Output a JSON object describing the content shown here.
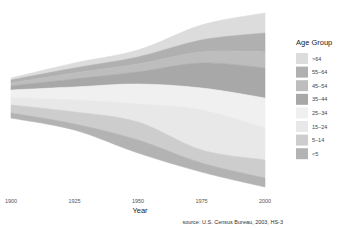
{
  "chart_data": {
    "type": "area",
    "subtype": "streamgraph",
    "title": "",
    "xlabel": "Year",
    "ylabel": "",
    "x": [
      1900,
      1925,
      1950,
      1975,
      2000
    ],
    "x_ticks": [
      "1900",
      "1925",
      "1950",
      "1975",
      "2000"
    ],
    "legend_title": "Age Group",
    "legend_position": "right",
    "grid": false,
    "source": "source: U.S. Census Bureau, 2003, HS-3",
    "series": [
      {
        "name": ">64",
        "color": "#dcdcdc",
        "values": [
          3.1,
          5.0,
          12.3,
          22.7,
          35.0
        ]
      },
      {
        "name": "55-64",
        "color": "#b0b0b0",
        "values": [
          4.0,
          7.0,
          13.4,
          19.0,
          24.3
        ]
      },
      {
        "name": "45-54",
        "color": "#bdbdbd",
        "values": [
          6.4,
          10.5,
          17.4,
          22.8,
          37.7
        ]
      },
      {
        "name": "35-44",
        "color": "#a8a8a8",
        "values": [
          9.1,
          14.0,
          21.5,
          25.6,
          45.1
        ]
      },
      {
        "name": "25-34",
        "color": "#f0f0f0",
        "values": [
          12.1,
          17.8,
          24.0,
          37.1,
          39.9
        ]
      },
      {
        "name": "15-24",
        "color": "#e8e8e8",
        "values": [
          14.9,
          20.7,
          22.1,
          39.6,
          39.2
        ]
      },
      {
        "name": "5-14",
        "color": "#cdcdcd",
        "values": [
          17.0,
          22.5,
          24.3,
          40.7,
          41.1
        ]
      },
      {
        "name": "<5",
        "color": "#b3b3b3",
        "values": [
          9.2,
          11.5,
          16.2,
          16.2,
          19.2
        ]
      }
    ],
    "units": "millions of people (approx.)"
  },
  "layout": {
    "plot": {
      "x0": 11,
      "x1": 265,
      "center_y": 100
    },
    "band_pixels": {
      "note": "top-to-bottom band boundaries (y px) at each x tick",
      "1900": [
        78,
        80,
        83,
        86,
        90,
        98,
        105,
        113,
        118
      ],
      "1925": [
        63,
        68,
        73,
        79,
        87,
        100,
        112,
        124,
        130
      ],
      "1950": [
        50,
        57,
        64,
        72,
        84,
        104,
        122,
        140,
        153
      ],
      "1975": [
        25,
        40,
        52,
        63,
        88,
        110,
        150,
        163,
        172
      ],
      "2000": [
        13,
        33,
        52,
        68,
        98,
        128,
        160,
        178,
        187
      ]
    }
  }
}
